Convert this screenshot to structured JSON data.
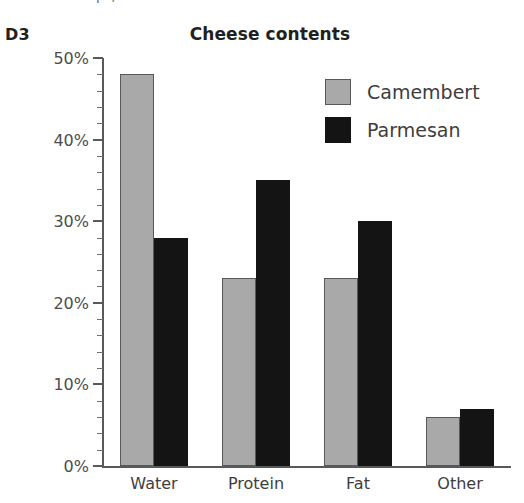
{
  "exercise_label": "D3",
  "top_clipped_text": "p              ,",
  "chart_data": {
    "type": "bar",
    "title": "Cheese contents",
    "xlabel": "",
    "ylabel": "",
    "categories": [
      "Water",
      "Protein",
      "Fat",
      "Other"
    ],
    "series": [
      {
        "name": "Camembert",
        "color": "#a9a9a9",
        "values": [
          48,
          23,
          23,
          6
        ]
      },
      {
        "name": "Parmesan",
        "color": "#141414",
        "values": [
          28,
          35,
          30,
          7
        ]
      }
    ],
    "ylim": [
      0,
      50
    ],
    "ytick_values": [
      0,
      10,
      20,
      30,
      40,
      50
    ],
    "ytick_labels": [
      "0%",
      "10%",
      "20%",
      "30%",
      "40%",
      "50%"
    ],
    "yminor_tick_step": 2,
    "y_unit": "%",
    "grid": false,
    "legend_position": "upper right",
    "legend_entries": [
      "Camembert",
      "Parmesan"
    ]
  }
}
